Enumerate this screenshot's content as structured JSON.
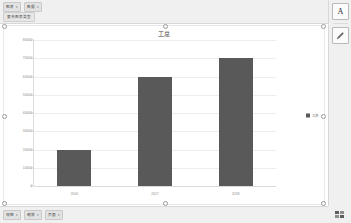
{
  "toolbar": {
    "buttons": [
      {
        "label": "图表",
        "caret": "▾",
        "name": "chart-type-dropdown"
      },
      {
        "label": "数据",
        "caret": "▾",
        "name": "chart-data-dropdown"
      }
    ],
    "secondary": [
      {
        "label": "更改图表类型",
        "name": "change-chart-type-button"
      }
    ]
  },
  "rail": {
    "buttons": [
      {
        "icon": "text-format-icon",
        "glyph": "A",
        "label": "A"
      },
      {
        "icon": "pencil-icon",
        "glyph": "✎",
        "label": "✎"
      }
    ]
  },
  "statusbar": {
    "buttons": [
      {
        "label": "视图",
        "caret": "▾",
        "name": "view-dropdown"
      },
      {
        "label": "缩放",
        "caret": "▾",
        "name": "zoom-dropdown"
      },
      {
        "label": "页面",
        "caret": "▾",
        "name": "page-dropdown"
      }
    ],
    "corner_icon": "grid-view-icon"
  },
  "chart_data": {
    "type": "bar",
    "title": "工总",
    "xlabel": "",
    "ylabel": "",
    "categories": [
      "2016",
      "2017",
      "2018"
    ],
    "series": [
      {
        "name": "工资",
        "values": [
          20000,
          60000,
          70000
        ]
      }
    ],
    "values": [
      20000,
      60000,
      70000
    ],
    "ylim": [
      0,
      80000
    ],
    "yticks": [
      0,
      10000,
      20000,
      30000,
      40000,
      50000,
      60000,
      70000,
      80000
    ],
    "ytick_labels": [
      "0",
      "10000",
      "20000",
      "30000",
      "40000",
      "50000",
      "60000",
      "70000",
      "80000"
    ],
    "grid": true,
    "legend": {
      "position": "right",
      "entries": [
        "工资"
      ]
    },
    "colors": {
      "bar": "#595959",
      "grid": "#ededed",
      "plot_bg": "#ffffff"
    }
  }
}
